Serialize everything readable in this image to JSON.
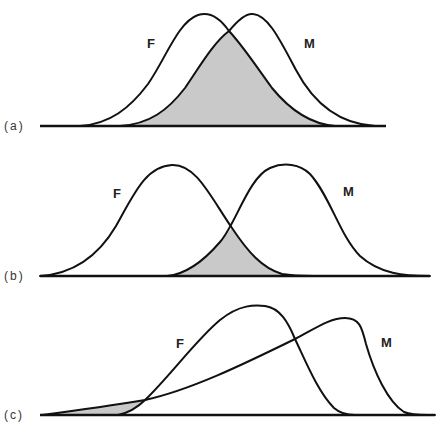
{
  "figure": {
    "colors": {
      "stroke": "#111111",
      "overlap_fill": "#c9c9c9",
      "background": "#ffffff"
    },
    "panels": [
      {
        "id": "a",
        "panel_label": "(a)",
        "curve_labels": {
          "female": "F",
          "male": "M"
        },
        "description": "Large overlap between two similar normal distributions"
      },
      {
        "id": "b",
        "panel_label": "(b)",
        "curve_labels": {
          "female": "F",
          "male": "M"
        },
        "description": "Smaller overlap between two further-apart normal distributions"
      },
      {
        "id": "c",
        "panel_label": "(c)",
        "curve_labels": {
          "female": "F",
          "male": "M"
        },
        "description": "Skewed distributions with overlap only in the lower tail"
      }
    ]
  }
}
